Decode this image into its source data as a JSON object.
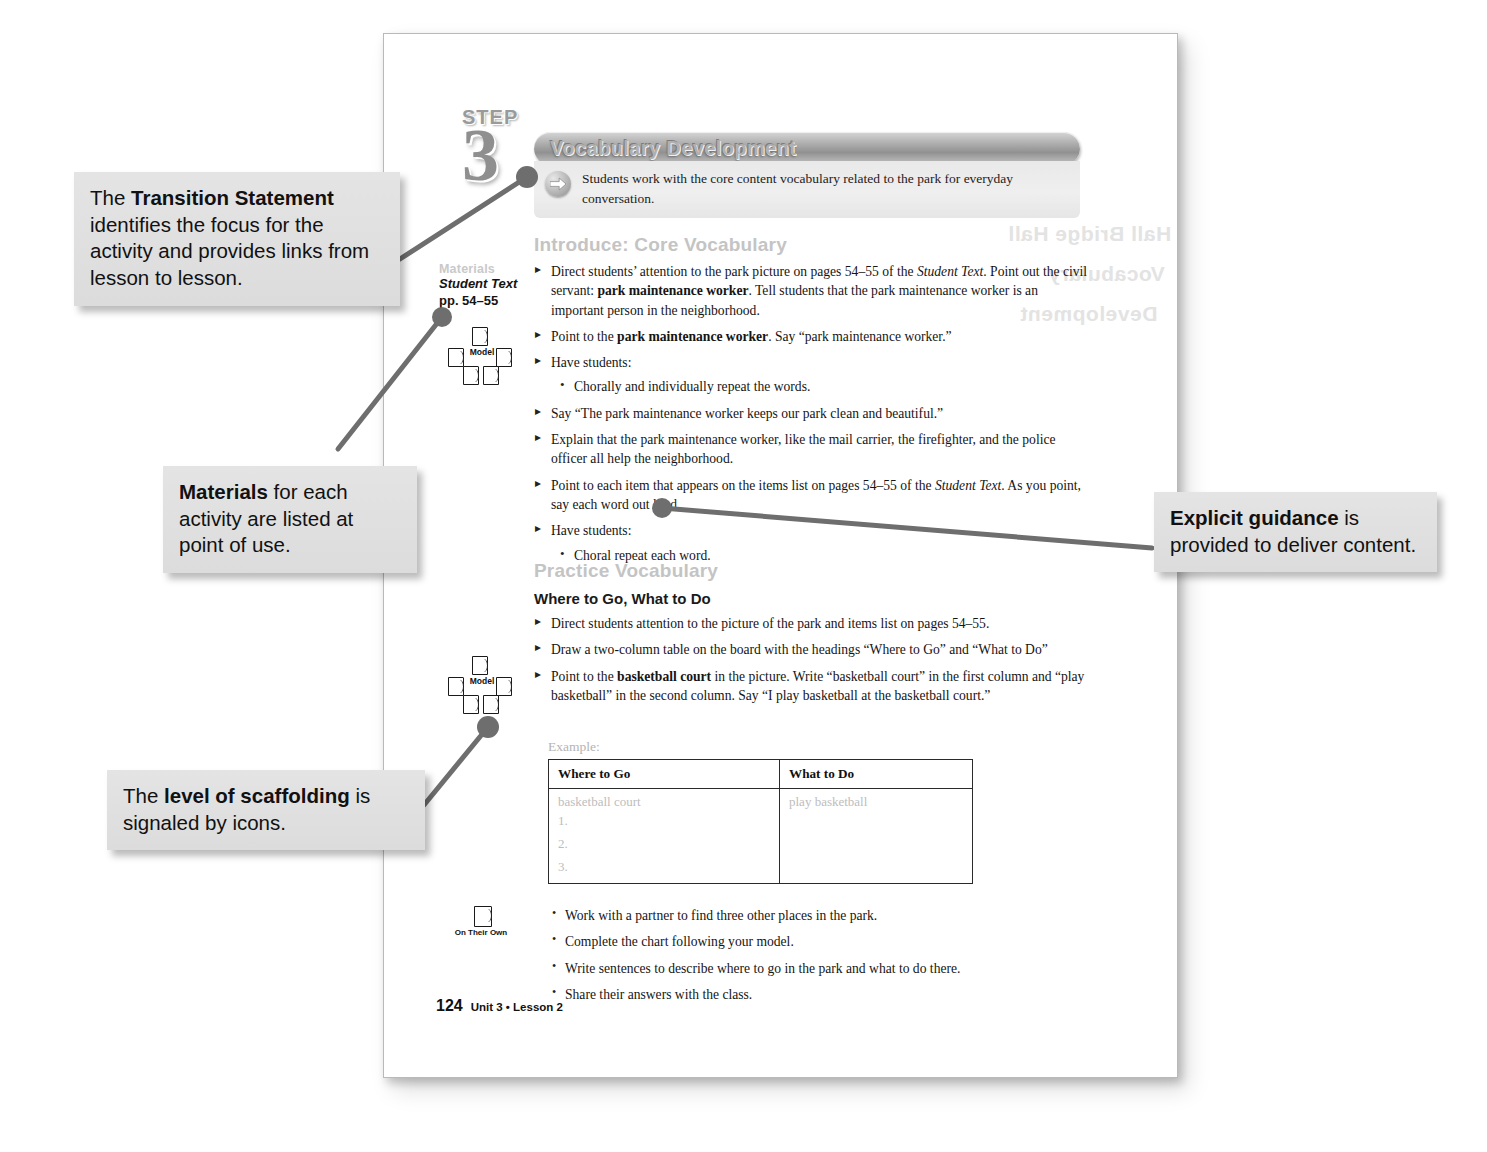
{
  "page": {
    "step_word": "STEP",
    "step_number": "3",
    "banner_title": "Vocabulary Development",
    "transition_statement": "Students work with the core content vocabulary related to the park for everyday conversation.",
    "showthrough_lines": [
      "Hall Bridge Hall",
      "Vocabulary",
      "Development"
    ],
    "footer": {
      "folio": "124",
      "meta": "Unit 3 • Lesson 2"
    }
  },
  "materials": {
    "label": "Materials",
    "lines": [
      "Student Text",
      "pp. 54–55"
    ]
  },
  "icons": {
    "arrow": "arrow-right-icon",
    "model_label": "Model",
    "on_their_own_label": "On Their Own"
  },
  "sections": [
    {
      "heading": "Introduce: Core Vocabulary",
      "items": [
        {
          "level": "bullet",
          "html": "Direct students’ attention to the park picture on pages 54–55 of the <i>Student Text</i>. Point out the civil servant: <b>park maintenance worker</b>. Tell students that the park maintenance worker is an important person in the neighborhood."
        },
        {
          "level": "bullet",
          "html": "Point to the <b>park maintenance worker</b>. Say “park maintenance worker.”"
        },
        {
          "level": "bullet",
          "html": "Have students:"
        },
        {
          "level": "sub",
          "html": "Chorally and individually repeat the words."
        },
        {
          "level": "bullet",
          "html": "Say “The park maintenance worker keeps our park clean and beautiful.”"
        },
        {
          "level": "bullet",
          "html": "Explain that the park maintenance worker, like the mail carrier, the firefighter, and the police officer all help the neighborhood."
        },
        {
          "level": "bullet",
          "html": "Point to each item that appears on the items list on pages 54–55 of the <i>Student Text</i>. As you point, say each word out loud."
        },
        {
          "level": "bullet",
          "html": "Have students:"
        },
        {
          "level": "sub",
          "html": "Choral repeat each word."
        }
      ]
    },
    {
      "heading": "Practice Vocabulary",
      "subheading": "Where to Go, What to Do",
      "items": [
        {
          "level": "bullet",
          "html": "Direct students attention to the picture of the park and items list on pages 54–55."
        },
        {
          "level": "bullet",
          "html": "Draw a two-column table on the board with the headings “Where to Go” and “What to Do”"
        },
        {
          "level": "bullet",
          "html": "Point to the <b>basketball court</b> in the picture. Write “basketball court” in the first column and “play basketball” in the second column. Say “I play basketball at the basketball court.”"
        }
      ],
      "example_label": "Example:"
    }
  ],
  "table": {
    "headers": [
      "Where to Go",
      "What to Do"
    ],
    "rows": [
      {
        "where": "basketball court",
        "what": "play basketball"
      },
      {
        "where": "1.",
        "what": ""
      },
      {
        "where": "2.",
        "what": ""
      },
      {
        "where": "3.",
        "what": ""
      }
    ]
  },
  "on_their_own_items": [
    "Work with a partner to find three other places in the park.",
    "Complete the chart following your model.",
    "Write sentences to describe where to go in the park and what to do there.",
    "Share their answers with the class."
  ],
  "callouts": [
    {
      "id": "transition",
      "html": "The <b>Transition Statement</b> identifies the focus for the activity and provides links from lesson to lesson."
    },
    {
      "id": "materials",
      "html": "<b>Materials</b> for each activity are listed at point of use."
    },
    {
      "id": "scaffold",
      "html": "The <b>level of scaffolding</b> is signaled by icons."
    },
    {
      "id": "guidance",
      "html": "<b>Explicit guidance</b> is provided to deliver content."
    }
  ],
  "colors": {
    "callout_bg": "#e0e0e0",
    "leader_line": "#6e6e6e",
    "section_heading": "#c4c4c4",
    "banner": "#9b9b9b",
    "table_placeholder": "#bdbdbd"
  }
}
